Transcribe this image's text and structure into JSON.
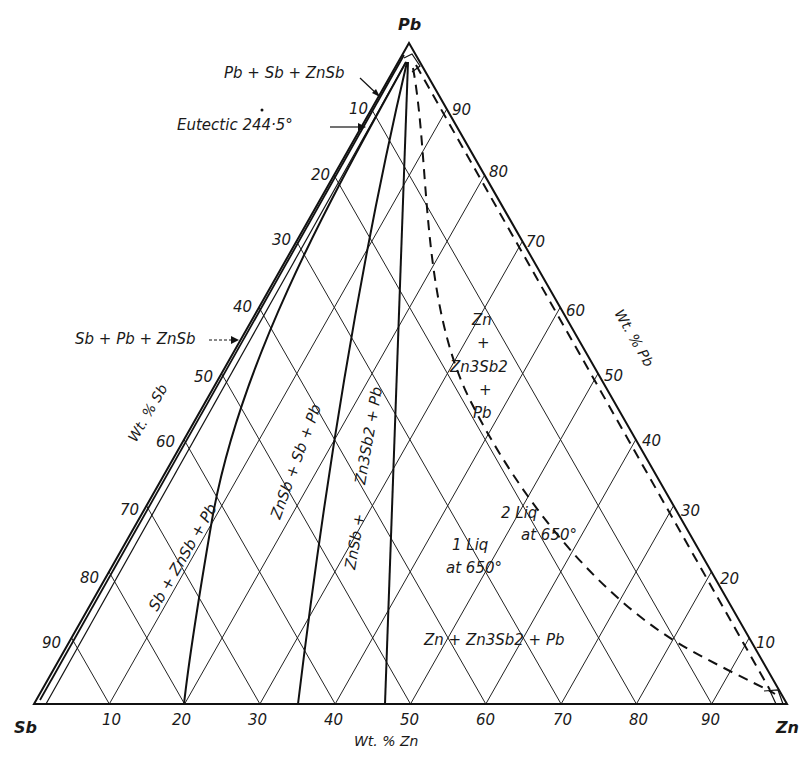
{
  "figure": {
    "type": "ternary-phase-diagram",
    "system": "Pb-Sb-Zn",
    "corners": {
      "top": "Pb",
      "left": "Sb",
      "right": "Zn"
    },
    "axes": {
      "bottom": {
        "title": "Wt. % Zn",
        "ticks": [
          "10",
          "20",
          "30",
          "40",
          "50",
          "60",
          "70",
          "80",
          "90"
        ]
      },
      "left": {
        "title": "Wt. % Sb",
        "ticks": [
          "10",
          "20",
          "30",
          "40",
          "50",
          "60",
          "70",
          "80",
          "90"
        ]
      },
      "right": {
        "title": "Wt. % Pb",
        "ticks": [
          "90",
          "80",
          "70",
          "60",
          "50",
          "40",
          "30",
          "20",
          "10"
        ]
      }
    },
    "annotations": {
      "pb_sb_znsb": "Pb + Sb + ZnSb",
      "eutectic": "Eutectic 244·5°",
      "sb_pb_znsb": "Sb + Pb + ZnSb"
    },
    "regions": {
      "r1": "Sb + ZnSb + Pb",
      "r2": "ZnSb + Sb + Pb",
      "r3a": "ZnSb +",
      "r3b": "Zn3Sb2 + Pb",
      "r4_line1": "Zn",
      "r4_line2": "+",
      "r4_line3": "Zn3Sb2",
      "r4_line4": "+",
      "r4_line5": "Pb",
      "two_liq_1": "2 Liq",
      "two_liq_2": "at 650°",
      "one_liq_1": "1 Liq",
      "one_liq_2": "at 650°",
      "bottom_region": "Zn + Zn3Sb2 + Pb"
    },
    "colors": {
      "ink": "#1a1a1a",
      "background": "#ffffff"
    }
  }
}
